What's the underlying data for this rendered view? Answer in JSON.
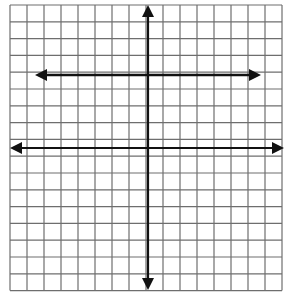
{
  "figure": {
    "width": 286,
    "height": 302,
    "background": "#ffffff"
  },
  "grid": {
    "left": 10,
    "top": 5,
    "columns": 16,
    "rows": 17,
    "cell_width": 17,
    "cell_height": 16.8,
    "line_color": "#6e6e6e",
    "line_width": 1.2
  },
  "axes": {
    "color": "#111111",
    "width": 2.2,
    "x_axis": {
      "y": 148,
      "x1": 10,
      "x2": 284,
      "arrows": [
        "left",
        "right"
      ]
    },
    "y_axis": {
      "x": 148,
      "y1": 5,
      "y2": 290,
      "arrows": [
        "up",
        "down"
      ]
    }
  },
  "lines": [
    {
      "name": "horizontal-line",
      "y": 75,
      "x1": 35,
      "x2": 261,
      "color": "#111111",
      "width": 2.4,
      "arrows": [
        "left",
        "right"
      ]
    }
  ]
}
